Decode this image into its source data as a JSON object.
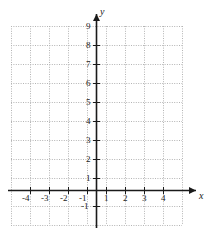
{
  "figure": {
    "kind": "cartesian-coordinate-grid",
    "background_color": "#ffffff",
    "grid_color": "#b4b4b4",
    "axis_color": "#1a1a1a",
    "label_color": "#1a1a1a"
  },
  "axes": {
    "x_axis_label": "x",
    "y_axis_label": "y",
    "x_tick_labels": [
      "-4",
      "-3",
      "-2",
      "-1",
      "1",
      "2",
      "3",
      "4"
    ],
    "y_tick_labels": [
      "9",
      "8",
      "7",
      "6",
      "5",
      "4",
      "3",
      "2",
      "1",
      "-1"
    ],
    "origin_label": ""
  },
  "chart_data": {
    "type": "scatter",
    "title": "",
    "subtitle": "",
    "xlabel": "x",
    "ylabel": "y",
    "xlim": [
      -4.5,
      4.5
    ],
    "ylim": [
      -1.8,
      10.4
    ],
    "xticks": [
      -4,
      -3,
      -2,
      -1,
      1,
      2,
      3,
      4
    ],
    "yticks": [
      9,
      8,
      7,
      6,
      5,
      4,
      3,
      2,
      1,
      -1
    ],
    "x": [],
    "y": [],
    "series": [],
    "grid": true,
    "grid_style": "dotted",
    "grid_spacing": 1,
    "legend": false,
    "legend_position": "none",
    "annotations": []
  }
}
